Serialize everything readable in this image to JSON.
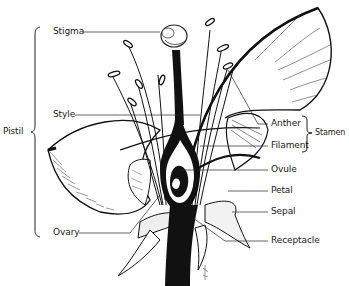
{
  "diagram": {
    "title_visible": false,
    "labels_left": [
      {
        "id": "stigma",
        "text": "Stigma",
        "x": 53,
        "y": 27
      },
      {
        "id": "style",
        "text": "Style",
        "x": 53,
        "y": 110
      },
      {
        "id": "ovary",
        "text": "Ovary",
        "x": 53,
        "y": 228
      }
    ],
    "group_left": {
      "id": "pistil",
      "text": "Pistil",
      "x": 3,
      "y": 127
    },
    "labels_right": [
      {
        "id": "anther",
        "text": "Anther",
        "x": 271,
        "y": 119
      },
      {
        "id": "filament",
        "text": "Filament",
        "x": 271,
        "y": 141
      },
      {
        "id": "ovule",
        "text": "Ovule",
        "x": 271,
        "y": 165
      },
      {
        "id": "petal",
        "text": "Petal",
        "x": 271,
        "y": 186
      },
      {
        "id": "sepal",
        "text": "Sepal",
        "x": 271,
        "y": 207
      },
      {
        "id": "receptacle",
        "text": "Receptacle",
        "x": 271,
        "y": 236
      }
    ],
    "group_right": {
      "id": "stamen",
      "text": "Stamen",
      "x": 318,
      "y": 129
    },
    "colors": {
      "ink": "#111111",
      "paper": "#ffffff",
      "hatch": "#555555"
    }
  }
}
